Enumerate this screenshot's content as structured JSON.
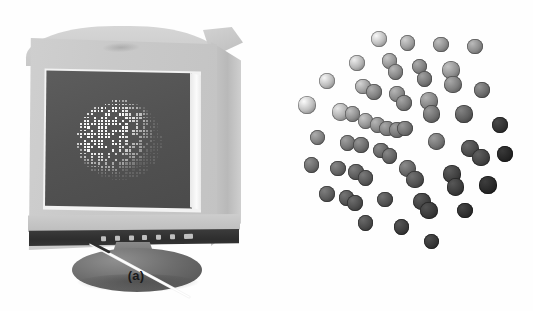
{
  "figure": {
    "background_color": "#ffffff",
    "width": 533,
    "height": 311,
    "kind": "two-panel grayscale photographic figure"
  },
  "panels": [
    {
      "id": "a",
      "caption": "(a)",
      "subject": "flat-panel computer monitor displaying a 3D point-cloud object",
      "screen": {
        "background_color": "#535353",
        "object_color": "#f2f2f2",
        "object_description": "bright faceted point cloud of small square dots forming a rounded polyhedral shell"
      },
      "bezel_color": "#c9c9c9",
      "control_strip_color": "#333333",
      "base_color": "#6d6d6d",
      "button_count": 7,
      "logo_text": ""
    },
    {
      "id": "b",
      "caption": "(b)",
      "subject": "cloud of shaded spheres arranged in a spiral disc",
      "background_color": "#ffffff",
      "sphere_count": 56,
      "shading_note": "brightness falls off from upper-left (white) to lower-right (near black)",
      "lightest_color": "#fafafa",
      "darkest_color": "#151515"
    }
  ],
  "captions": {
    "a": "(a)",
    "b": "(b)"
  },
  "chart_data": {
    "type": "scatter",
    "title": "",
    "xlabel": "",
    "ylabel": "",
    "note": "panel (b): each point is a shaded sphere; value = gray level 0(dark)-1(light)",
    "spheres": [
      {
        "x": 148,
        "y": 10,
        "r": 9,
        "v": 0.97
      },
      {
        "x": 196,
        "y": 14,
        "r": 9,
        "v": 0.78
      },
      {
        "x": 252,
        "y": 16,
        "r": 9,
        "v": 0.7
      },
      {
        "x": 308,
        "y": 18,
        "r": 9,
        "v": 0.68
      },
      {
        "x": 112,
        "y": 36,
        "r": 9,
        "v": 0.92
      },
      {
        "x": 166,
        "y": 34,
        "r": 9,
        "v": 0.74
      },
      {
        "x": 176,
        "y": 46,
        "r": 9,
        "v": 0.66
      },
      {
        "x": 216,
        "y": 40,
        "r": 9,
        "v": 0.62
      },
      {
        "x": 224,
        "y": 54,
        "r": 9,
        "v": 0.56
      },
      {
        "x": 268,
        "y": 44,
        "r": 10,
        "v": 0.72
      },
      {
        "x": 272,
        "y": 60,
        "r": 10,
        "v": 0.6
      },
      {
        "x": 62,
        "y": 56,
        "r": 9,
        "v": 0.96
      },
      {
        "x": 122,
        "y": 62,
        "r": 9,
        "v": 0.8
      },
      {
        "x": 140,
        "y": 68,
        "r": 9,
        "v": 0.62
      },
      {
        "x": 178,
        "y": 70,
        "r": 9,
        "v": 0.66
      },
      {
        "x": 190,
        "y": 80,
        "r": 9,
        "v": 0.58
      },
      {
        "x": 232,
        "y": 78,
        "r": 10,
        "v": 0.64
      },
      {
        "x": 236,
        "y": 92,
        "r": 10,
        "v": 0.52
      },
      {
        "x": 320,
        "y": 66,
        "r": 9,
        "v": 0.5
      },
      {
        "x": 28,
        "y": 82,
        "r": 10,
        "v": 0.98
      },
      {
        "x": 84,
        "y": 90,
        "r": 10,
        "v": 0.88
      },
      {
        "x": 104,
        "y": 92,
        "r": 9,
        "v": 0.7
      },
      {
        "x": 126,
        "y": 100,
        "r": 9,
        "v": 0.74
      },
      {
        "x": 146,
        "y": 104,
        "r": 9,
        "v": 0.66
      },
      {
        "x": 162,
        "y": 108,
        "r": 9,
        "v": 0.6
      },
      {
        "x": 178,
        "y": 110,
        "r": 9,
        "v": 0.56
      },
      {
        "x": 192,
        "y": 108,
        "r": 9,
        "v": 0.52
      },
      {
        "x": 290,
        "y": 92,
        "r": 10,
        "v": 0.42
      },
      {
        "x": 350,
        "y": 104,
        "r": 9,
        "v": 0.16
      },
      {
        "x": 46,
        "y": 118,
        "r": 9,
        "v": 0.62
      },
      {
        "x": 96,
        "y": 124,
        "r": 9,
        "v": 0.56
      },
      {
        "x": 118,
        "y": 126,
        "r": 9,
        "v": 0.5
      },
      {
        "x": 152,
        "y": 132,
        "r": 9,
        "v": 0.46
      },
      {
        "x": 166,
        "y": 138,
        "r": 9,
        "v": 0.44
      },
      {
        "x": 244,
        "y": 122,
        "r": 10,
        "v": 0.54
      },
      {
        "x": 300,
        "y": 130,
        "r": 10,
        "v": 0.3
      },
      {
        "x": 318,
        "y": 140,
        "r": 10,
        "v": 0.26
      },
      {
        "x": 358,
        "y": 136,
        "r": 9,
        "v": 0.08
      },
      {
        "x": 36,
        "y": 148,
        "r": 9,
        "v": 0.48
      },
      {
        "x": 80,
        "y": 152,
        "r": 9,
        "v": 0.44
      },
      {
        "x": 110,
        "y": 156,
        "r": 9,
        "v": 0.4
      },
      {
        "x": 126,
        "y": 162,
        "r": 9,
        "v": 0.38
      },
      {
        "x": 196,
        "y": 152,
        "r": 10,
        "v": 0.46
      },
      {
        "x": 208,
        "y": 164,
        "r": 10,
        "v": 0.34
      },
      {
        "x": 270,
        "y": 158,
        "r": 10,
        "v": 0.24
      },
      {
        "x": 276,
        "y": 172,
        "r": 10,
        "v": 0.22
      },
      {
        "x": 330,
        "y": 170,
        "r": 10,
        "v": 0.1
      },
      {
        "x": 62,
        "y": 180,
        "r": 9,
        "v": 0.4
      },
      {
        "x": 94,
        "y": 184,
        "r": 9,
        "v": 0.36
      },
      {
        "x": 108,
        "y": 190,
        "r": 9,
        "v": 0.32
      },
      {
        "x": 158,
        "y": 186,
        "r": 9,
        "v": 0.34
      },
      {
        "x": 220,
        "y": 188,
        "r": 10,
        "v": 0.24
      },
      {
        "x": 232,
        "y": 198,
        "r": 10,
        "v": 0.2
      },
      {
        "x": 292,
        "y": 198,
        "r": 9,
        "v": 0.14
      },
      {
        "x": 126,
        "y": 212,
        "r": 9,
        "v": 0.3
      },
      {
        "x": 186,
        "y": 216,
        "r": 9,
        "v": 0.22
      },
      {
        "x": 236,
        "y": 232,
        "r": 9,
        "v": 0.18
      }
    ]
  }
}
